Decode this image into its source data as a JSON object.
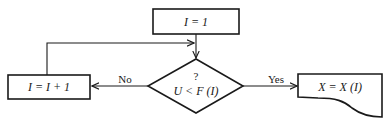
{
  "diagram": {
    "type": "flowchart",
    "nodes": {
      "init": {
        "shape": "process",
        "text": "I = 1"
      },
      "decision": {
        "shape": "decision",
        "question_mark": "?",
        "text": "U < F (I)"
      },
      "increment": {
        "shape": "process",
        "text": "I = I + 1"
      },
      "output": {
        "shape": "document",
        "text": "X = X (I)"
      }
    },
    "edges": [
      {
        "from": "init",
        "to": "decision",
        "label": ""
      },
      {
        "from": "decision",
        "to": "increment",
        "label": "No"
      },
      {
        "from": "decision",
        "to": "output",
        "label": "Yes"
      },
      {
        "from": "increment",
        "to": "decision",
        "label": ""
      }
    ],
    "colors": {
      "stroke": "#1a1a1a",
      "background": "#ffffff"
    }
  }
}
